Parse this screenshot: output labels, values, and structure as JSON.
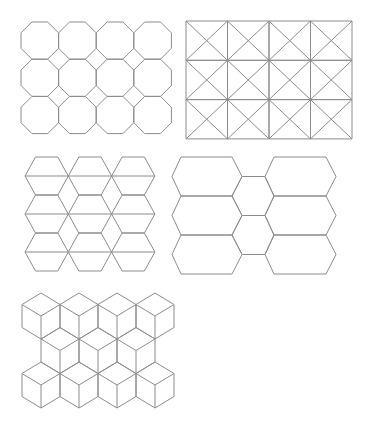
{
  "figure": {
    "background": "#ffffff",
    "stroke_color": "#8c8c8c",
    "panels": [
      {
        "id": "octagon-square-tiling",
        "type": "truncated-square",
        "origin": [
          21,
          22
        ],
        "cols": 4,
        "rows": 3,
        "pitch": [
          37.6,
          37.2
        ],
        "cut": 10.9
      },
      {
        "id": "tetrakis-square-tiling",
        "type": "square-with-diagonals",
        "origin": [
          186,
          21
        ],
        "cols": 4,
        "rows": 3,
        "cell": [
          41.5,
          39.3
        ]
      },
      {
        "id": "split-hexagon-rhombus-tiling",
        "type": "split-hexagon-columns",
        "origin_x": 25,
        "top_y": 157,
        "cols": 3,
        "hexes_per_col": 3,
        "hex_width": 43.3,
        "hex_height": 38,
        "inset": 10.5
      },
      {
        "id": "elongated-hexagon-tiling",
        "type": "elongated-hexagons",
        "left_column": {
          "x_left": 172,
          "x_top_l": 181,
          "x_top_r": 232,
          "x_right": 242
        },
        "right_column": {
          "x_left": 265,
          "x_top_l": 274,
          "x_top_r": 326,
          "x_right": 336
        },
        "top_y": 157,
        "hex_height": 39,
        "count": 3,
        "middle_hexes": 2
      },
      {
        "id": "cube-rhombille-tiling",
        "type": "stacked-cubes",
        "first_center_x": 41,
        "pitch_x": 38,
        "rows": [
          {
            "apex_y": 293,
            "offset": 0,
            "count": 4
          },
          {
            "apex_y": 327.5,
            "offset": 19,
            "count": 3
          },
          {
            "apex_y": 362,
            "offset": 0,
            "count": 4
          }
        ],
        "hex_height": 46
      }
    ]
  }
}
